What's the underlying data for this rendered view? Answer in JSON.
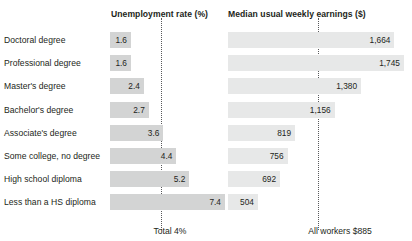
{
  "headers": {
    "row_label_column": "",
    "unemployment": "Unemployment rate (%)",
    "earnings": "Median usual weekly earnings ($)"
  },
  "footer": {
    "total_unemployment": "Total 4%",
    "total_earnings": "All workers $885"
  },
  "colors": {
    "bar_left": "#d3d4d4",
    "bar_right": "#e7e8e8",
    "text": "#231f20",
    "reference_line": "#58595b",
    "background": "#ffffff"
  },
  "rows": [
    {
      "label": "Doctoral degree",
      "unemployment_text": "1.6",
      "earnings_text": "1,664"
    },
    {
      "label": "Professional degree",
      "unemployment_text": "1.6",
      "earnings_text": "1,745"
    },
    {
      "label": "Master's degree",
      "unemployment_text": "2.4",
      "earnings_text": "1,380"
    },
    {
      "label": "Bachelor's degree",
      "unemployment_text": "2.7",
      "earnings_text": "1,156"
    },
    {
      "label": "Associate's degree",
      "unemployment_text": "3.6",
      "earnings_text": "819"
    },
    {
      "label": "Some college, no degree",
      "unemployment_text": "4.4",
      "earnings_text": "756"
    },
    {
      "label": "High school diploma",
      "unemployment_text": "5.2",
      "earnings_text": "692"
    },
    {
      "label": "Less than a HS diploma",
      "unemployment_text": "7.4",
      "earnings_text": "504"
    }
  ],
  "chart_data": {
    "type": "bar",
    "title": "",
    "orientation": "horizontal",
    "panels": [
      {
        "name": "unemployment-rate",
        "title": "Unemployment rate (%)",
        "unit": "%",
        "categories": [
          "Doctoral degree",
          "Professional degree",
          "Master's degree",
          "Bachelor's degree",
          "Associate's degree",
          "Some college, no degree",
          "High school diploma",
          "Less than a HS diploma"
        ],
        "values": [
          1.6,
          1.6,
          2.4,
          2.7,
          3.6,
          4.4,
          5.2,
          7.4
        ],
        "xlim": [
          0,
          7.4
        ],
        "reference_line": {
          "label": "Total 4%",
          "value": 4
        },
        "grid": false
      },
      {
        "name": "median-weekly-earnings",
        "title": "Median usual weekly earnings ($)",
        "unit": "$",
        "categories": [
          "Doctoral degree",
          "Professional degree",
          "Master's degree",
          "Bachelor's degree",
          "Associate's degree",
          "Some college, no degree",
          "High school diploma",
          "Less than a HS diploma"
        ],
        "values": [
          1664,
          1745,
          1380,
          1156,
          819,
          756,
          692,
          504
        ],
        "xlim": [
          0,
          1745
        ],
        "reference_line": {
          "label": "All workers $885",
          "value": 885
        },
        "grid": false
      }
    ],
    "legend": null,
    "xlabel": "",
    "ylabel": ""
  },
  "layout": {
    "row_top_start": 32,
    "row_pitch": 23.2,
    "bar_height": 16,
    "left_bar_x": 110,
    "left_bar_max_width": 115,
    "left_bar_min_width": 21,
    "right_bar_x": 228,
    "right_bar_max_width": 176,
    "right_bar_min_width": 30,
    "ref_left_x": 161,
    "ref_right_x": 318
  }
}
